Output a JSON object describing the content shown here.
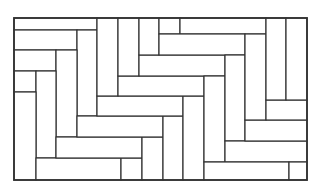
{
  "diagram": {
    "type": "rectangle-tiling",
    "frame": {
      "x": 14,
      "y": 18,
      "w": 293,
      "h": 162
    },
    "stroke_color": "#333333",
    "fill_color": "#ffffff",
    "rects": [
      {
        "x": 14,
        "y": 18,
        "w": 83,
        "h": 12
      },
      {
        "x": 14,
        "y": 30,
        "w": 63,
        "h": 20
      },
      {
        "x": 77,
        "y": 30,
        "w": 20,
        "h": 86
      },
      {
        "x": 14,
        "y": 50,
        "w": 42,
        "h": 21
      },
      {
        "x": 56,
        "y": 50,
        "w": 21,
        "h": 87
      },
      {
        "x": 14,
        "y": 71,
        "w": 22,
        "h": 21
      },
      {
        "x": 36,
        "y": 71,
        "w": 20,
        "h": 87
      },
      {
        "x": 14,
        "y": 92,
        "w": 22,
        "h": 88
      },
      {
        "x": 36,
        "y": 158,
        "w": 85,
        "h": 22
      },
      {
        "x": 121,
        "y": 158,
        "w": 21,
        "h": 22
      },
      {
        "x": 56,
        "y": 137,
        "w": 86,
        "h": 21
      },
      {
        "x": 142,
        "y": 137,
        "w": 21,
        "h": 43
      },
      {
        "x": 77,
        "y": 116,
        "w": 86,
        "h": 21
      },
      {
        "x": 163,
        "y": 116,
        "w": 20,
        "h": 64
      },
      {
        "x": 97,
        "y": 96,
        "w": 86,
        "h": 20
      },
      {
        "x": 183,
        "y": 96,
        "w": 21,
        "h": 84
      },
      {
        "x": 97,
        "y": 18,
        "w": 21,
        "h": 78
      },
      {
        "x": 118,
        "y": 76,
        "w": 86,
        "h": 20
      },
      {
        "x": 118,
        "y": 18,
        "w": 21,
        "h": 58
      },
      {
        "x": 139,
        "y": 55,
        "w": 86,
        "h": 21
      },
      {
        "x": 139,
        "y": 18,
        "w": 20,
        "h": 37
      },
      {
        "x": 159,
        "y": 18,
        "w": 21,
        "h": 16
      },
      {
        "x": 180,
        "y": 18,
        "w": 86,
        "h": 16
      },
      {
        "x": 159,
        "y": 34,
        "w": 86,
        "h": 21
      },
      {
        "x": 204,
        "y": 76,
        "w": 21,
        "h": 86
      },
      {
        "x": 225,
        "y": 55,
        "w": 20,
        "h": 86
      },
      {
        "x": 225,
        "y": 141,
        "w": 82,
        "h": 21
      },
      {
        "x": 245,
        "y": 120,
        "w": 62,
        "h": 21
      },
      {
        "x": 245,
        "y": 34,
        "w": 21,
        "h": 86
      },
      {
        "x": 266,
        "y": 100,
        "w": 41,
        "h": 20
      },
      {
        "x": 266,
        "y": 18,
        "w": 20,
        "h": 82
      },
      {
        "x": 286,
        "y": 18,
        "w": 21,
        "h": 82
      },
      {
        "x": 204,
        "y": 162,
        "w": 85,
        "h": 18
      },
      {
        "x": 289,
        "y": 162,
        "w": 18,
        "h": 18
      }
    ]
  }
}
